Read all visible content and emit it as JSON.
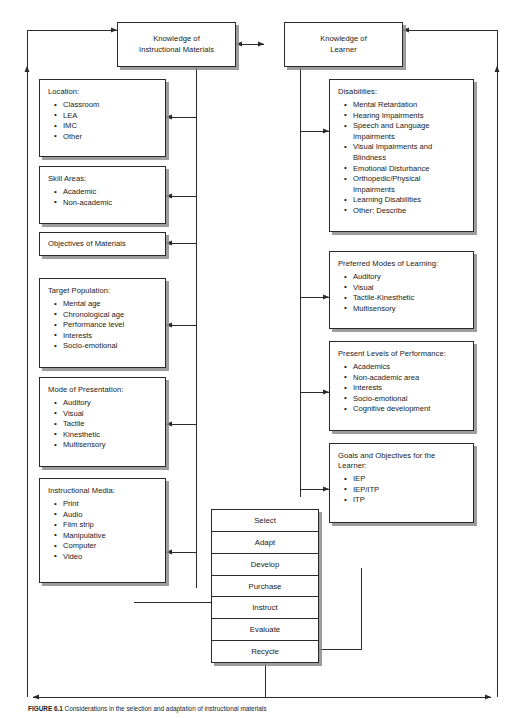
{
  "figure": {
    "caption_label": "FIGURE 6.1",
    "caption_text": "Considerations in the selection and adaptation of instructional materials"
  },
  "colors": {
    "line": "#2a2a2a",
    "box_border": "#2a2a2a",
    "box_fill": "#ffffff",
    "shadow": "#8c8c8c",
    "page_background": "#ffffff"
  },
  "headers": [
    {
      "name": "knowledge-of-instructional-materials",
      "title": "Knowledge of\nInstructional Materials"
    },
    {
      "name": "knowledge-of-learner",
      "title": "Knowledge of\nLearner"
    }
  ],
  "left_column": [
    {
      "name": "location",
      "title": "Location:",
      "items": [
        "Classroom",
        "LEA",
        "IMC",
        "Other"
      ]
    },
    {
      "name": "skill-areas",
      "title": "Skill Areas:",
      "items": [
        "Academic",
        "Non-academic"
      ]
    },
    {
      "name": "objectives-of-materials",
      "title": "Objectives of Materials",
      "items": []
    },
    {
      "name": "target-population",
      "title": "Target Population:",
      "items": [
        "Mental age",
        "Chronological age",
        "Performance level",
        "Interests",
        "Socio-emotional"
      ]
    },
    {
      "name": "mode-of-presentation",
      "title": "Mode of Presentation:",
      "items": [
        "Auditory",
        "Visual",
        "Tactile",
        "Kinesthetic",
        "Multisensory"
      ]
    },
    {
      "name": "instructional-media",
      "title": "Instructional Media:",
      "items": [
        "Print",
        "Audio",
        "Film strip",
        "Manipulative",
        "Computer",
        "Video"
      ]
    }
  ],
  "right_column": [
    {
      "name": "disabilities",
      "title": "Disabilities:",
      "items": [
        "Mental Retardation",
        "Hearing Impairments",
        "Speech and Language\nImpairments",
        "Visual Impairments and\nBlindness",
        "Emotional Disturbance",
        "Orthopedic/Physical\nImpairments",
        "Learning Disabilities",
        "Other: Describe"
      ]
    },
    {
      "name": "preferred-modes-of-learning",
      "title": "Preferred Modes of Learning:",
      "items": [
        "Auditory",
        "Visual",
        "Tactile-Kinesthetic",
        "Multisensory"
      ]
    },
    {
      "name": "present-levels-of-performance",
      "title": "Present Levels of Performance:",
      "items": [
        "Academics",
        "Non-academic area",
        "Interests",
        "Socio-emotional",
        "Cognitive development"
      ]
    },
    {
      "name": "goals-and-objectives",
      "title": "Goals and Objectives for the\nLearner:",
      "items": [
        "IEP",
        "IEP/ITP",
        "ITP"
      ]
    }
  ],
  "process_stack": {
    "name": "process-steps",
    "steps": [
      "Select",
      "Adapt",
      "Develop",
      "Purchase",
      "Instruct",
      "Evaluate",
      "Recycle"
    ]
  }
}
